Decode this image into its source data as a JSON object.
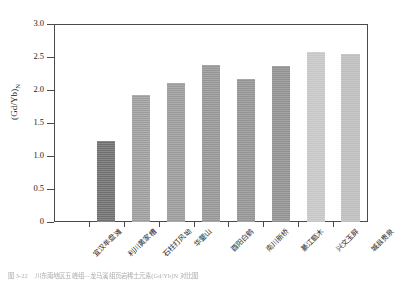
{
  "chart_data": {
    "type": "bar",
    "title": "",
    "xlabel": "",
    "ylabel": "(Gd/Yb)N",
    "ylim": [
      0,
      3.0
    ],
    "ytick_values": [
      "3.0",
      "2.5",
      "2.0",
      "1.5",
      "1.0",
      "0.5",
      "0"
    ],
    "grid": false,
    "legend": "none",
    "categories": [
      "宜汉牟盘滩",
      "利川黄家槽",
      "石柱打风坳",
      "华蓥山",
      "酉阳白鹤",
      "南川新桥",
      "綦江甑木",
      "兴文玉屏",
      "城县贵泉"
    ],
    "values": [
      0,
      1.23,
      1.93,
      2.11,
      2.38,
      2.17,
      2.36,
      2.58,
      2.55
    ],
    "bar_colors": [
      "#ffffff",
      "#6f6f6f",
      "#9d9d9d",
      "#9a9a9a",
      "#959595",
      "#939393",
      "#909090",
      "#c6c6c6",
      "#bdbdbd"
    ]
  },
  "axis": {
    "ylabel_main": "(Gd/Yb)",
    "ylabel_sub": "N"
  },
  "caption": {
    "number": "图 3-22",
    "text": "川东南地区五峰组—龙马溪组页岩稀土元素(Gd/Yb)N 对比图"
  }
}
